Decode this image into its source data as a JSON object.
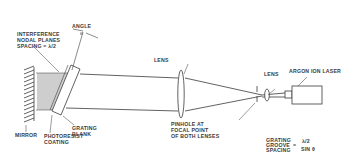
{
  "diagram": {
    "colors": {
      "line": "#3a3a3a",
      "background": "#ffffff"
    },
    "labels": {
      "angle": "ANGLE",
      "angle_symbol": "θ",
      "interference_line1": "INTERFERENCE",
      "interference_line2": "NODAL PLANES",
      "interference_line3": "SPACING = λ/2",
      "lens_1": "LENS",
      "lens_2": "LENS",
      "laser": "ARGON ION LASER",
      "mirror": "MIRROR",
      "photoresist_line1": "PHOTORESIST",
      "photoresist_line2": "COATING",
      "grating_blank_line1": "GRATING",
      "grating_blank_line2": "BLANK",
      "pinhole_line1": "PINHOLE AT",
      "pinhole_line2": "FOCAL POINT",
      "pinhole_line3": "OF BOTH LENSES",
      "formula_left_line1": "GRATING",
      "formula_left_line2": "GROOVE",
      "formula_left_line3": "SPACING",
      "formula_equals": "=",
      "formula_numerator": "λ/2",
      "formula_denominator": "SIN θ"
    },
    "components": [
      {
        "name": "mirror",
        "icon": "hatched-mirror"
      },
      {
        "name": "grating-blank",
        "icon": "tilted-rectangle"
      },
      {
        "name": "collimating-lens",
        "icon": "biconvex-lens"
      },
      {
        "name": "pinhole",
        "icon": "pinhole-aperture"
      },
      {
        "name": "focusing-lens",
        "icon": "small-biconvex-lens"
      },
      {
        "name": "argon-ion-laser",
        "icon": "laser-box"
      }
    ]
  }
}
